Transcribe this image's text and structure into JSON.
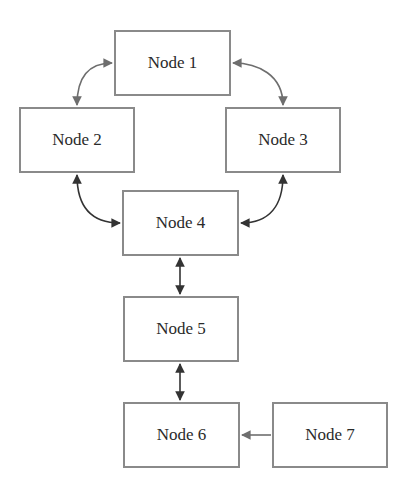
{
  "diagram": {
    "type": "flowchart",
    "colors": {
      "border": "#8a8a8a",
      "edge_gray": "#6e6e6e",
      "edge_dark": "#333333",
      "text": "#2a2a2a"
    },
    "nodes": [
      {
        "id": "n1",
        "label": "Node 1",
        "x": 114,
        "y": 30,
        "w": 117,
        "h": 66
      },
      {
        "id": "n2",
        "label": "Node 2",
        "x": 19,
        "y": 107,
        "w": 116,
        "h": 66
      },
      {
        "id": "n3",
        "label": "Node 3",
        "x": 225,
        "y": 107,
        "w": 116,
        "h": 66
      },
      {
        "id": "n4",
        "label": "Node 4",
        "x": 122,
        "y": 190,
        "w": 117,
        "h": 66
      },
      {
        "id": "n5",
        "label": "Node 5",
        "x": 123,
        "y": 296,
        "w": 116,
        "h": 66
      },
      {
        "id": "n6",
        "label": "Node 6",
        "x": 123,
        "y": 402,
        "w": 117,
        "h": 66
      },
      {
        "id": "n7",
        "label": "Node 7",
        "x": 272,
        "y": 402,
        "w": 116,
        "h": 66
      }
    ],
    "edges": [
      {
        "from": "n1",
        "to": "n2",
        "direction": "bidirectional",
        "style": "curved"
      },
      {
        "from": "n1",
        "to": "n3",
        "direction": "bidirectional",
        "style": "curved"
      },
      {
        "from": "n2",
        "to": "n4",
        "direction": "bidirectional",
        "style": "curved"
      },
      {
        "from": "n3",
        "to": "n4",
        "direction": "bidirectional",
        "style": "curved"
      },
      {
        "from": "n4",
        "to": "n5",
        "direction": "bidirectional",
        "style": "straight"
      },
      {
        "from": "n5",
        "to": "n6",
        "direction": "bidirectional",
        "style": "straight"
      },
      {
        "from": "n7",
        "to": "n6",
        "direction": "forward",
        "style": "straight"
      }
    ]
  }
}
